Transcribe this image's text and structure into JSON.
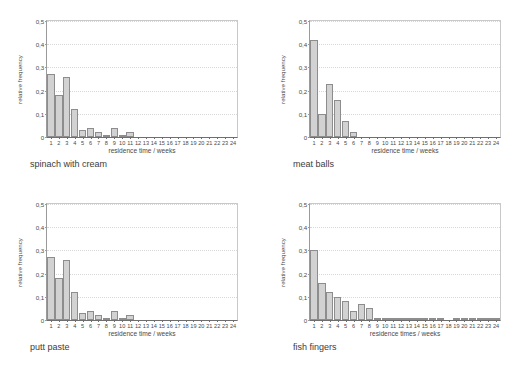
{
  "figure": {
    "axis": {
      "y_ticks": [
        "0,5",
        "0,4",
        "0,3",
        "0,2",
        "0,1",
        "0"
      ],
      "y_tick_values": [
        0.5,
        0.4,
        0.3,
        0.2,
        0.1,
        0
      ],
      "ylim": [
        0,
        0.5
      ],
      "xlim": [
        0.5,
        24.5
      ],
      "x_ticks": [
        "1",
        "2",
        "3",
        "4",
        "5",
        "6",
        "7",
        "8",
        "9",
        "10",
        "11",
        "12",
        "13",
        "14",
        "15",
        "16",
        "17",
        "18",
        "19",
        "20",
        "21",
        "22",
        "23",
        "24"
      ],
      "ylabel": "relative frequency"
    },
    "bar_fill": "#d2d2d2",
    "bar_stroke": "#8d8d8d"
  },
  "chart_data": [
    {
      "type": "bar",
      "title": "spinach with cream",
      "caption": "spinach with cream",
      "xlabel": "residence time / weeks",
      "ylabel": "relative frequency",
      "categories": [
        1,
        2,
        3,
        4,
        5,
        6,
        7,
        8,
        9,
        10,
        11,
        12,
        13,
        14,
        15,
        16,
        17,
        18,
        19,
        20,
        21,
        22,
        23,
        24
      ],
      "values": [
        0.27,
        0.18,
        0.26,
        0.12,
        0.03,
        0.04,
        0.02,
        0.01,
        0.04,
        0.01,
        0.02,
        0,
        0,
        0,
        0,
        0,
        0,
        0,
        0,
        0,
        0,
        0,
        0,
        0
      ],
      "ylim": [
        0,
        0.5
      ],
      "grid": true,
      "legend": "none"
    },
    {
      "type": "bar",
      "title": "meat balls",
      "caption": "meat balls",
      "xlabel": "residence time / weeks",
      "ylabel": "relative frequency",
      "categories": [
        1,
        2,
        3,
        4,
        5,
        6,
        7,
        8,
        9,
        10,
        11,
        12,
        13,
        14,
        15,
        16,
        17,
        18,
        19,
        20,
        21,
        22,
        23,
        24
      ],
      "values": [
        0.42,
        0.1,
        0.23,
        0.16,
        0.07,
        0.02,
        0,
        0,
        0,
        0,
        0,
        0,
        0,
        0,
        0,
        0,
        0,
        0,
        0,
        0,
        0,
        0,
        0,
        0
      ],
      "ylim": [
        0,
        0.5
      ],
      "grid": true,
      "legend": "none"
    },
    {
      "type": "bar",
      "title": "putt paste",
      "caption": "putt paste",
      "xlabel": "residence time / weeks",
      "ylabel": "relative frequency",
      "categories": [
        1,
        2,
        3,
        4,
        5,
        6,
        7,
        8,
        9,
        10,
        11,
        12,
        13,
        14,
        15,
        16,
        17,
        18,
        19,
        20,
        21,
        22,
        23,
        24
      ],
      "values": [
        0.27,
        0.18,
        0.26,
        0.12,
        0.03,
        0.04,
        0.02,
        0.01,
        0.04,
        0.01,
        0.02,
        0,
        0,
        0,
        0,
        0,
        0,
        0,
        0,
        0,
        0,
        0,
        0,
        0
      ],
      "ylim": [
        0,
        0.5
      ],
      "grid": true,
      "legend": "none"
    },
    {
      "type": "bar",
      "title": "fish fingers",
      "caption": "fish fingers",
      "xlabel": "residence times / weeks",
      "ylabel": "relative frequency",
      "categories": [
        1,
        2,
        3,
        4,
        5,
        6,
        7,
        8,
        9,
        10,
        11,
        12,
        13,
        14,
        15,
        16,
        17,
        18,
        19,
        20,
        21,
        22,
        23,
        24
      ],
      "values": [
        0.3,
        0.16,
        0.12,
        0.1,
        0.08,
        0.04,
        0.07,
        0.05,
        0.005,
        0.008,
        0.003,
        0.003,
        0.003,
        0.003,
        0.003,
        0.008,
        0.003,
        0,
        0.004,
        0.005,
        0.008,
        0.004,
        0.003,
        0.003
      ],
      "ylim": [
        0,
        0.5
      ],
      "grid": true,
      "legend": "none"
    }
  ]
}
